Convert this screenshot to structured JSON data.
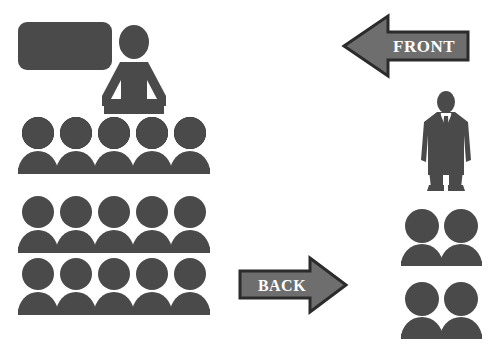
{
  "diagram": {
    "background_color": "#ffffff",
    "figure_color": "#4a4a4a",
    "arrow_fill_color": "#6e6e6e",
    "arrow_stroke_color": "#2b2b2b",
    "label_color": "#ffffff"
  },
  "board": {
    "name": "whiteboard",
    "shape": "rounded-rectangle",
    "color": "#4a4a4a"
  },
  "presenter": {
    "name": "teacher-at-podium",
    "color": "#4a4a4a",
    "parts": [
      "head",
      "torso-with-arms",
      "desk"
    ]
  },
  "arrows": [
    {
      "name": "front-arrow",
      "label": "FRONT",
      "direction": "left",
      "fill": "#6e6e6e",
      "stroke": "#2b2b2b"
    },
    {
      "name": "back-arrow",
      "label": "BACK",
      "direction": "right",
      "fill": "#6e6e6e",
      "stroke": "#2b2b2b"
    }
  ],
  "audience": {
    "name": "seated-audience",
    "rows": 3,
    "seats_per_row": 5,
    "color": "#4a4a4a",
    "row_labels": [
      "row-1",
      "row-2",
      "row-3"
    ]
  },
  "standing_person": {
    "name": "standing-businessman",
    "color": "#4a4a4a",
    "attire": "suit-and-tie"
  },
  "side_groups": [
    {
      "name": "side-pair-upper",
      "count": 2,
      "color": "#4a4a4a"
    },
    {
      "name": "side-pair-lower",
      "count": 2,
      "color": "#4a4a4a"
    }
  ]
}
